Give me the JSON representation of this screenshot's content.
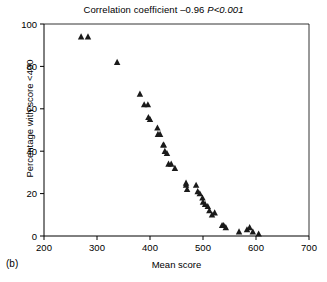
{
  "figure": {
    "panel_label": "(b)",
    "title_prefix": "Correlation coefficient –0.96 ",
    "title_pvalue": "P<0.001"
  },
  "chart_data": {
    "type": "scatter",
    "title": "Correlation coefficient –0.96 P<0.001",
    "subtitle": "",
    "xlabel": "Mean score",
    "ylabel": "Percentage with score <400",
    "xlim": [
      200,
      700
    ],
    "ylim": [
      0,
      100
    ],
    "xticks": [
      200,
      300,
      400,
      500,
      600,
      700
    ],
    "yticks": [
      0,
      20,
      40,
      60,
      80,
      100
    ],
    "grid": false,
    "legend": null,
    "marker": "triangle",
    "marker_color": "#1a1a1a",
    "annotations": {
      "correlation_coefficient": -0.96,
      "p_value": "<0.001"
    },
    "series": [
      {
        "name": "Schools",
        "points": [
          [
            270,
            94
          ],
          [
            283,
            94
          ],
          [
            338,
            82
          ],
          [
            381,
            67
          ],
          [
            389,
            62
          ],
          [
            396,
            62
          ],
          [
            397,
            56
          ],
          [
            400,
            55
          ],
          [
            414,
            51
          ],
          [
            415,
            48
          ],
          [
            419,
            48
          ],
          [
            425,
            43
          ],
          [
            426,
            43
          ],
          [
            428,
            40
          ],
          [
            432,
            39
          ],
          [
            435,
            34
          ],
          [
            440,
            34
          ],
          [
            447,
            32
          ],
          [
            468,
            24
          ],
          [
            468,
            25
          ],
          [
            470,
            22
          ],
          [
            487,
            24
          ],
          [
            490,
            21
          ],
          [
            494,
            20
          ],
          [
            499,
            18
          ],
          [
            500,
            16
          ],
          [
            504,
            15
          ],
          [
            509,
            14
          ],
          [
            512,
            12
          ],
          [
            517,
            10
          ],
          [
            522,
            11
          ],
          [
            536,
            5
          ],
          [
            539,
            5
          ],
          [
            543,
            4
          ],
          [
            568,
            2
          ],
          [
            583,
            3
          ],
          [
            588,
            4
          ],
          [
            594,
            2
          ],
          [
            605,
            1
          ]
        ]
      }
    ]
  }
}
